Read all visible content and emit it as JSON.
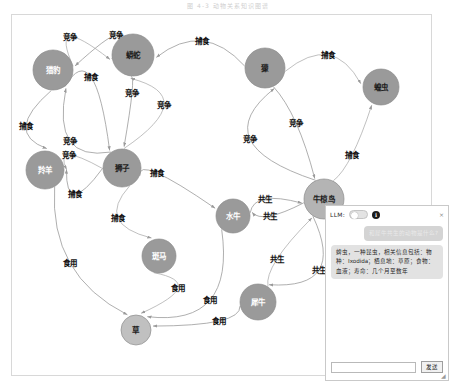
{
  "caption": "图 4-3   动物关系知识图谱",
  "graph": {
    "title": "animal-relation-knowledge-graph",
    "nodes": [
      {
        "id": "leopard",
        "label": "猎豹",
        "x": 41,
        "y": 55,
        "r": 20,
        "fill": "#9a9a9a",
        "light": true
      },
      {
        "id": "python",
        "label": "蟒蛇",
        "x": 121,
        "y": 40,
        "r": 21,
        "fill": "#9a9a9a",
        "light": false
      },
      {
        "id": "mongoose",
        "label": "獴",
        "x": 253,
        "y": 53,
        "r": 20,
        "fill": "#9a9a9a",
        "light": false
      },
      {
        "id": "locust",
        "label": "蝗虫",
        "x": 369,
        "y": 72,
        "r": 18,
        "fill": "#9a9a9a",
        "light": false
      },
      {
        "id": "antelope",
        "label": "羚羊",
        "x": 33,
        "y": 155,
        "r": 19,
        "fill": "#9a9a9a",
        "light": true
      },
      {
        "id": "lion",
        "label": "狮子",
        "x": 110,
        "y": 153,
        "r": 19,
        "fill": "#9a9a9a",
        "light": false
      },
      {
        "id": "buffalo",
        "label": "水牛",
        "x": 221,
        "y": 201,
        "r": 17,
        "fill": "#9a9a9a",
        "light": true
      },
      {
        "id": "oxpecker",
        "label": "牛椋鸟",
        "x": 312,
        "y": 184,
        "r": 20,
        "fill": "#b4b4b4",
        "light": false
      },
      {
        "id": "zebra",
        "label": "斑马",
        "x": 147,
        "y": 241,
        "r": 17,
        "fill": "#9a9a9a",
        "light": true
      },
      {
        "id": "rhino",
        "label": "犀牛",
        "x": 246,
        "y": 287,
        "r": 18,
        "fill": "#9a9a9a",
        "light": true
      },
      {
        "id": "grass",
        "label": "草",
        "x": 124,
        "y": 315,
        "r": 15,
        "fill": "#c0c0c0",
        "light": false
      }
    ],
    "relations": {
      "compete": "竞争",
      "prey": "捕食",
      "symbiosis": "共生",
      "eat": "食用"
    },
    "edges": [
      {
        "from": "leopard",
        "to": "python",
        "label": "竞争",
        "lx": 58,
        "ly": 22
      },
      {
        "from": "python",
        "to": "leopard",
        "label": "竞争",
        "lx": 104,
        "ly": 20
      },
      {
        "from": "mongoose",
        "to": "python",
        "label": "捕食",
        "lx": 190,
        "ly": 26
      },
      {
        "from": "mongoose",
        "to": "locust",
        "label": "捕食",
        "lx": 316,
        "ly": 40
      },
      {
        "from": "leopard",
        "to": "lion",
        "label": "捕食",
        "lx": 79,
        "ly": 62
      },
      {
        "from": "python",
        "to": "lion",
        "label": "竞争",
        "lx": 120,
        "ly": 78
      },
      {
        "from": "lion",
        "to": "python",
        "label": "竞争",
        "lx": 152,
        "ly": 90
      },
      {
        "from": "leopard",
        "to": "antelope",
        "label": "捕食",
        "lx": 14,
        "ly": 111
      },
      {
        "from": "lion",
        "to": "leopard",
        "label": "竞争",
        "lx": 58,
        "ly": 126
      },
      {
        "from": "lion",
        "to": "antelope",
        "label": "竞争",
        "lx": 57,
        "ly": 140
      },
      {
        "from": "lion",
        "to": "antelope",
        "label": "捕食",
        "lx": 63,
        "ly": 179
      },
      {
        "from": "lion",
        "to": "buffalo",
        "label": "捕食",
        "lx": 145,
        "ly": 158
      },
      {
        "from": "lion",
        "to": "zebra",
        "label": "捕食",
        "lx": 106,
        "ly": 203
      },
      {
        "from": "oxpecker",
        "to": "mongoose",
        "label": "竞争",
        "lx": 238,
        "ly": 124
      },
      {
        "from": "mongoose",
        "to": "oxpecker",
        "label": "竞争",
        "lx": 284,
        "ly": 108
      },
      {
        "from": "oxpecker",
        "to": "locust",
        "label": "捕食",
        "lx": 340,
        "ly": 140
      },
      {
        "from": "buffalo",
        "to": "oxpecker",
        "label": "共生",
        "lx": 253,
        "ly": 184
      },
      {
        "from": "oxpecker",
        "to": "buffalo",
        "label": "共生",
        "lx": 258,
        "ly": 201
      },
      {
        "from": "rhino",
        "to": "oxpecker",
        "label": "共生",
        "lx": 265,
        "ly": 244
      },
      {
        "from": "oxpecker",
        "to": "rhino",
        "label": "共生",
        "lx": 307,
        "ly": 255
      },
      {
        "from": "antelope",
        "to": "grass",
        "label": "食用",
        "lx": 58,
        "ly": 248
      },
      {
        "from": "zebra",
        "to": "grass",
        "label": "食用",
        "lx": 166,
        "ly": 273
      },
      {
        "from": "buffalo",
        "to": "grass",
        "label": "食用",
        "lx": 198,
        "ly": 285
      },
      {
        "from": "rhino",
        "to": "grass",
        "label": "食用",
        "lx": 207,
        "ly": 306
      }
    ]
  },
  "chat": {
    "llm_label": "LLM:",
    "toggle_state": "off",
    "info_icon": "i",
    "close_icon": "×",
    "messages": [
      {
        "role": "user",
        "text": "和犀牛共生的动物是什么?"
      },
      {
        "role": "bot",
        "text": "蜱虫，一种昆虫，相关信息包括：物种：Ixodida；栖息地：草原；食物：血液；寿命：几个月至数年"
      }
    ],
    "input_value": "",
    "input_placeholder": "",
    "send_label": "发送",
    "resize_grip": "◢"
  }
}
